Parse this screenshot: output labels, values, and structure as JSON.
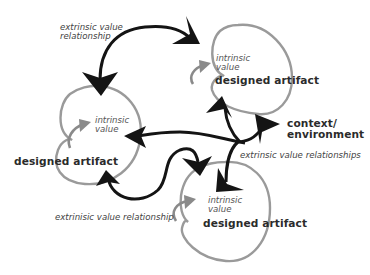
{
  "diagram": {
    "nodes": [
      {
        "id": "artifact-left",
        "intrinsic_label": "intrinsic\nvalue",
        "intrinsic_line1": "intrinsic",
        "intrinsic_line2": "value",
        "title": "designed artifact"
      },
      {
        "id": "artifact-top-right",
        "intrinsic_line1": "intrinsic",
        "intrinsic_line2": "value",
        "title": "designed artifact"
      },
      {
        "id": "artifact-bottom",
        "intrinsic_line1": "intrinsic",
        "intrinsic_line2": "value",
        "title": "designed artifact"
      },
      {
        "id": "context",
        "line1": "context/",
        "line2": "environment"
      }
    ],
    "edge_labels": {
      "top_left_line1": "extrinsic value",
      "top_left_line2": "relationship",
      "right": "extrinsic value relationships",
      "bottom_left": "extrinisic value relationship"
    },
    "colors": {
      "circle_stroke": "#9a9a9a",
      "arrow_black": "#141414",
      "intrinsic_arrow": "#8a8a8a",
      "text": "#333333"
    }
  }
}
